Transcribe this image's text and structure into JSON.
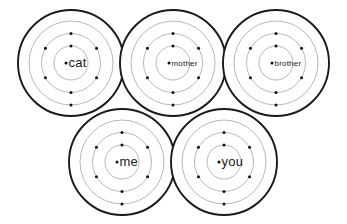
{
  "figure": {
    "background_color": "#ffffff",
    "width": 347,
    "height": 224,
    "outer_stroke_color": "#1a1a1a",
    "inner_ring_color": "#9a9a9a",
    "dot_color": "#111111",
    "label_color": "#1a1a1a"
  },
  "nodes": [
    {
      "id": "cat",
      "label": "cat",
      "cx": 71,
      "cy": 63,
      "outer_r": 53,
      "outer_stroke_width": 1.9,
      "font_size": 13,
      "label_dx": 5,
      "rings": [
        17,
        29.5,
        42
      ],
      "dots": [
        {
          "ring": 0,
          "angle": 270
        },
        {
          "ring": 1,
          "angle": 270
        },
        {
          "ring": 1,
          "angle": 210
        },
        {
          "ring": 1,
          "angle": 330
        },
        {
          "ring": 1,
          "angle": 150
        },
        {
          "ring": 1,
          "angle": 30
        },
        {
          "ring": 1,
          "angle": 90
        },
        {
          "ring": 2,
          "angle": 90
        }
      ]
    },
    {
      "id": "mother",
      "label": "mother",
      "cx": 173,
      "cy": 63,
      "outer_r": 53,
      "outer_stroke_width": 1.9,
      "font_size": 8,
      "label_dx": 4,
      "rings": [
        17,
        29.5,
        42
      ],
      "dots": [
        {
          "ring": 0,
          "angle": 270
        },
        {
          "ring": 1,
          "angle": 270
        },
        {
          "ring": 1,
          "angle": 210
        },
        {
          "ring": 1,
          "angle": 330
        },
        {
          "ring": 1,
          "angle": 150
        },
        {
          "ring": 1,
          "angle": 30
        },
        {
          "ring": 1,
          "angle": 90
        },
        {
          "ring": 2,
          "angle": 90
        }
      ]
    },
    {
      "id": "brother",
      "label": "brother",
      "cx": 276,
      "cy": 63,
      "outer_r": 53,
      "outer_stroke_width": 1.9,
      "font_size": 8,
      "label_dx": 4,
      "rings": [
        17,
        29.5,
        42
      ],
      "dots": [
        {
          "ring": 0,
          "angle": 270
        },
        {
          "ring": 1,
          "angle": 270
        },
        {
          "ring": 1,
          "angle": 210
        },
        {
          "ring": 1,
          "angle": 330
        },
        {
          "ring": 1,
          "angle": 150
        },
        {
          "ring": 1,
          "angle": 30
        },
        {
          "ring": 1,
          "angle": 90
        },
        {
          "ring": 2,
          "angle": 90
        }
      ]
    },
    {
      "id": "me",
      "label": "me",
      "cx": 122,
      "cy": 162,
      "outer_r": 53,
      "outer_stroke_width": 1.9,
      "font_size": 13,
      "label_dx": 5,
      "rings": [
        17,
        29.5,
        42
      ],
      "dots": [
        {
          "ring": 0,
          "angle": 270
        },
        {
          "ring": 1,
          "angle": 270
        },
        {
          "ring": 1,
          "angle": 210
        },
        {
          "ring": 1,
          "angle": 330
        },
        {
          "ring": 1,
          "angle": 150
        },
        {
          "ring": 1,
          "angle": 30
        },
        {
          "ring": 1,
          "angle": 90
        },
        {
          "ring": 2,
          "angle": 90
        }
      ]
    },
    {
      "id": "you",
      "label": "you",
      "cx": 224,
      "cy": 162,
      "outer_r": 53,
      "outer_stroke_width": 1.9,
      "font_size": 13,
      "label_dx": 5,
      "rings": [
        17,
        29.5,
        42
      ],
      "dots": [
        {
          "ring": 0,
          "angle": 270
        },
        {
          "ring": 1,
          "angle": 270
        },
        {
          "ring": 1,
          "angle": 210
        },
        {
          "ring": 1,
          "angle": 330
        },
        {
          "ring": 1,
          "angle": 150
        },
        {
          "ring": 1,
          "angle": 30
        },
        {
          "ring": 1,
          "angle": 90
        },
        {
          "ring": 2,
          "angle": 90
        }
      ]
    }
  ]
}
